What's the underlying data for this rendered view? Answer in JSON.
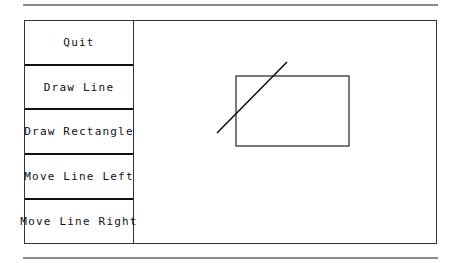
{
  "buttons": [
    {
      "label": "Quit",
      "name": "quit-button"
    },
    {
      "label": "Draw Line",
      "name": "draw-line-button"
    },
    {
      "label": "Draw Rectangle",
      "name": "draw-rectangle-button"
    },
    {
      "label": "Move Line Left",
      "name": "move-line-left-button"
    },
    {
      "label": "Move Line Right",
      "name": "move-line-right-button"
    }
  ],
  "canvas": {
    "line": {
      "x1": 216,
      "y1": 133,
      "x2": 286,
      "y2": 62,
      "color": "#111111"
    },
    "rectangle": {
      "x": 235,
      "y": 76,
      "width": 113,
      "height": 70,
      "color": "#333333"
    }
  }
}
